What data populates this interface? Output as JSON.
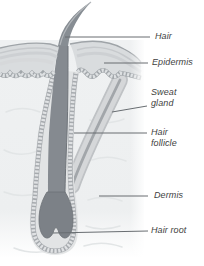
{
  "figure": {
    "name": "Human skin and hair anatomy cross-section",
    "type": "labeled-diagram",
    "labels": {
      "hair": "Hair",
      "epidermis": "Epidermis",
      "sweat_gland": "Sweat gland",
      "hair_follicle": "Hair follicle",
      "dermis": "Dermis",
      "hair_root": "Hair root"
    },
    "colors": {
      "background": "#ffffff",
      "dermis_fill": "#eef0f1",
      "dermis_texture": "#e2e5e6",
      "epidermis_fill": "#d9dcde",
      "epidermis_stripe": "#c6c9cc",
      "follicle_sheath_fill": "#e2e4e5",
      "cell_bead": "#e0e2e4",
      "cell_bead_base": "#a6aaae",
      "hair_fill": "#858a90",
      "hair_root_fill": "#7c8187",
      "sweat_gland_fill": "#d5d7d9",
      "sweat_gland_core": "#a2a6aa",
      "leader_line": "#686d71",
      "label_text": "#3e3e3e"
    }
  }
}
